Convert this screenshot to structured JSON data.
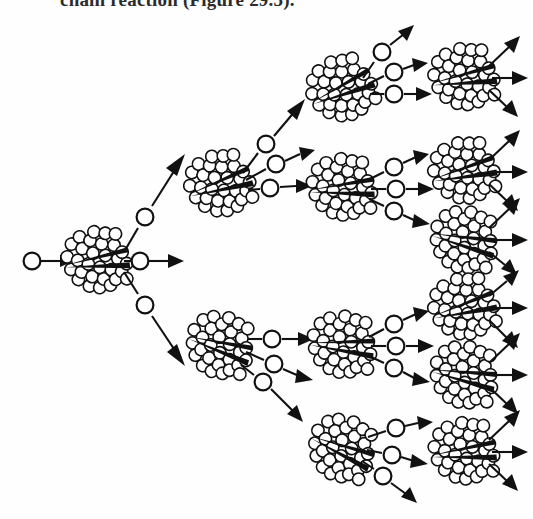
{
  "page": {
    "caption_fragment": "chain reaction (Figure 29.5).",
    "background_color": "#fefefe",
    "ink_color": "#111111",
    "width": 533,
    "height": 519
  },
  "figure": {
    "generations": [
      {
        "index": 1,
        "label": "Generation 1",
        "nucleus_count": 1,
        "neutrons_emitted_per_nucleus": 3,
        "has_incident_neutron": true
      },
      {
        "index": 2,
        "label": "Generation 2",
        "nucleus_count": 2,
        "neutrons_emitted_per_nucleus": 3,
        "has_incident_neutron": false
      },
      {
        "index": 3,
        "label": "Generation 3",
        "nucleus_count": 4,
        "neutrons_emitted_per_nucleus": 3,
        "has_incident_neutron": false
      },
      {
        "index": 4,
        "label": "Generation 4",
        "nucleus_count": 6,
        "neutrons_emitted_per_nucleus": 3,
        "has_incident_neutron": false,
        "note": "terminal nuclei emit bare arrows with no neutron circles; column is cropped by the figure edge"
      }
    ],
    "symbols": {
      "nucleus": "cluster of small open circles split by a dark wedge",
      "neutron": "small open circle on an arrow shaft",
      "trajectory": "straight line ending in a solid triangular arrowhead"
    },
    "nuclei": [
      {
        "id": "g1-n1",
        "generation": 1,
        "cx": 95,
        "cy": 261,
        "rot": -8
      },
      {
        "id": "g2-n1",
        "generation": 2,
        "cx": 218,
        "cy": 185,
        "rot": -18
      },
      {
        "id": "g2-n2",
        "generation": 2,
        "cx": 218,
        "cy": 345,
        "rot": 16
      },
      {
        "id": "g3-n1",
        "generation": 3,
        "cx": 340,
        "cy": 90,
        "rot": -24
      },
      {
        "id": "g3-n2",
        "generation": 3,
        "cx": 340,
        "cy": 188,
        "rot": -4
      },
      {
        "id": "g3-n3",
        "generation": 3,
        "cx": 340,
        "cy": 345,
        "rot": 4
      },
      {
        "id": "g3-n4",
        "generation": 3,
        "cx": 340,
        "cy": 448,
        "rot": 22
      },
      {
        "id": "g4-n1",
        "generation": 4,
        "cx": 462,
        "cy": 78,
        "rot": -10
      },
      {
        "id": "g4-n2",
        "generation": 4,
        "cx": 462,
        "cy": 172,
        "rot": -14
      },
      {
        "id": "g4-n3",
        "generation": 4,
        "cx": 462,
        "cy": 240,
        "rot": 12
      },
      {
        "id": "g4-n4",
        "generation": 4,
        "cx": 462,
        "cy": 308,
        "rot": -16
      },
      {
        "id": "g4-n5",
        "generation": 4,
        "cx": 462,
        "cy": 375,
        "rot": 10
      },
      {
        "id": "g4-n6",
        "generation": 4,
        "cx": 462,
        "cy": 452,
        "rot": -6
      }
    ],
    "incident_neutron": {
      "id": "incident",
      "x": 32,
      "y": 261
    },
    "counts": {
      "total_nuclei_shown": 13,
      "total_neutrons_shown": 21,
      "neutrons_per_fission": 3
    }
  }
}
